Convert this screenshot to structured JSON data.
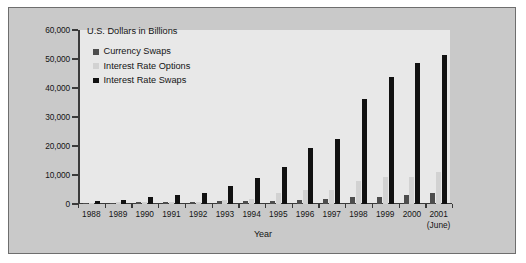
{
  "chart_data": {
    "type": "bar",
    "title": "U.S. Dollars in Billions",
    "xlabel": "Year",
    "ylabel": "U.S. Dollars in Billions",
    "ylim": [
      0,
      60000
    ],
    "ytick_labels": [
      "60,000",
      "50,000",
      "40,000",
      "30,000",
      "20,000",
      "10,000",
      "0"
    ],
    "ytick_values": [
      60000,
      50000,
      40000,
      30000,
      20000,
      10000,
      0
    ],
    "grid": false,
    "legend_position": "top-left inside plot",
    "categories": [
      "1988",
      "1989",
      "1990",
      "1991",
      "1992",
      "1993",
      "1994",
      "1995",
      "1996",
      "1997",
      "1998",
      "1999",
      "2000",
      "2001"
    ],
    "category_sublabels": [
      "",
      "",
      "",
      "",
      "",
      "",
      "",
      "",
      "",
      "",
      "",
      "",
      "",
      "(June)"
    ],
    "series": [
      {
        "name": "Currency Swaps",
        "color": "#4d4d4d",
        "values": [
          320,
          450,
          580,
          807,
          860,
          900,
          915,
          1197,
          1295,
          1824,
          2253,
          2444,
          3194,
          3942
        ]
      },
      {
        "name": "Interest Rate Options",
        "color": "#d2d2d2",
        "values": [
          327,
          537,
          561,
          577,
          634,
          1398,
          1573,
          3704,
          4723,
          4920,
          7997,
          9380,
          9476,
          10933
        ]
      },
      {
        "name": "Interest Rate Swaps",
        "color": "#111111",
        "values": [
          1010,
          1503,
          2312,
          3065,
          3851,
          6177,
          8816,
          12811,
          19171,
          22291,
          36262,
          43936,
          48768,
          51407
        ]
      }
    ]
  },
  "legend": {
    "items": [
      {
        "label": "Currency Swaps",
        "color": "#4d4d4d"
      },
      {
        "label": "Interest Rate Options",
        "color": "#d2d2d2"
      },
      {
        "label": "Interest Rate Swaps",
        "color": "#111111"
      }
    ]
  }
}
